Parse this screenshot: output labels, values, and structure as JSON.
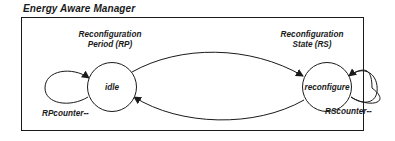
{
  "diagram": {
    "title": "Energy Aware Manager",
    "states": [
      {
        "id": "idle",
        "label": "idle",
        "group_label_lines": [
          "Reconfiguration",
          "Period (RP)"
        ],
        "self_loop_label": "RPcounter--"
      },
      {
        "id": "reconfigure",
        "label": "reconfigure",
        "group_label_lines": [
          "Reconfiguration",
          "State (RS)"
        ],
        "self_loop_label": "RScounter--"
      }
    ],
    "transitions": [
      {
        "from": "idle",
        "to": "idle",
        "type": "self-loop",
        "label": "RPcounter--"
      },
      {
        "from": "idle",
        "to": "reconfigure",
        "type": "arc-top"
      },
      {
        "from": "reconfigure",
        "to": "idle",
        "type": "arc-bottom"
      },
      {
        "from": "reconfigure",
        "to": "reconfigure",
        "type": "self-loop",
        "label": "RScounter--"
      }
    ],
    "colors": {
      "stroke": "#1a1a1a",
      "background": "#ffffff"
    }
  }
}
